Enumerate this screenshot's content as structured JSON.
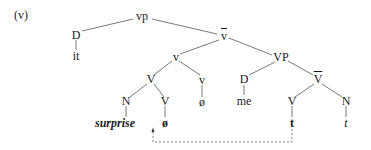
{
  "example_label": "(v)",
  "nodes": {
    "root": "vp",
    "d_subject": "D",
    "d_subject_word": "it",
    "v_bar": "v",
    "v_complex": "v",
    "vp": "VP",
    "V_compound": "V",
    "v_head": "v",
    "v_null": "ø",
    "d_object": "D",
    "d_object_word": "me",
    "V_bar": "V",
    "n_incorporated": "N",
    "v_incorporated": "V",
    "surprise": "surprise",
    "v_null_bold": "ø",
    "V_lower": "V",
    "n_lower": "N",
    "trace_v": "t",
    "trace_n": "t"
  },
  "arrow": {
    "from": "trace_v",
    "to": "surprise/ø",
    "style": "dashed"
  }
}
